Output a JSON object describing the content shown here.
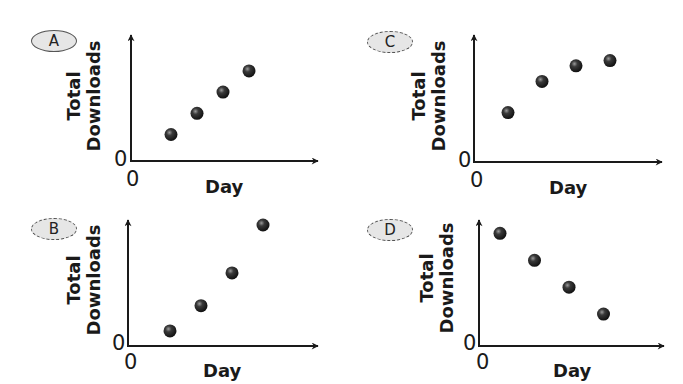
{
  "chart_data": [
    {
      "id": "A",
      "type": "scatter",
      "badge": "A",
      "title": "",
      "xlabel": "Day",
      "ylabel_line1": "Total",
      "ylabel_line2": "Downloads",
      "x_origin_label": "0",
      "y_origin_label": "0",
      "grid": false,
      "trend": "increasing linear",
      "x": [
        1,
        2,
        3,
        4
      ],
      "y": [
        1,
        1.8,
        2.6,
        3.4
      ],
      "xlim": [
        0,
        7.2
      ],
      "ylim": [
        0,
        4.8
      ]
    },
    {
      "id": "C",
      "type": "scatter",
      "badge": "C",
      "title": "",
      "xlabel": "Day",
      "ylabel_line1": "Total",
      "ylabel_line2": "Downloads",
      "x_origin_label": "0",
      "y_origin_label": "0",
      "grid": false,
      "trend": "increasing, leveling off",
      "x": [
        1,
        2,
        3,
        4
      ],
      "y": [
        1.9,
        3.1,
        3.7,
        3.9
      ],
      "xlim": [
        0,
        6.0
      ],
      "ylim": [
        0,
        5.0
      ]
    },
    {
      "id": "B",
      "type": "scatter",
      "badge": "B",
      "title": "",
      "xlabel": "Day",
      "ylabel_line1": "Total",
      "ylabel_line2": "Downloads",
      "x_origin_label": "0",
      "y_origin_label": "0",
      "grid": false,
      "trend": "increasing, accelerating",
      "x": [
        1,
        2,
        3,
        4
      ],
      "y": [
        0.6,
        1.6,
        2.9,
        4.8
      ],
      "xlim": [
        0,
        6.1
      ],
      "ylim": [
        0,
        5.0
      ]
    },
    {
      "id": "D",
      "type": "scatter",
      "badge": "D",
      "title": "",
      "xlabel": "Day",
      "ylabel_line1": "Total",
      "ylabel_line2": "Downloads",
      "x_origin_label": "0",
      "y_origin_label": "0",
      "grid": false,
      "trend": "decreasing linear",
      "x": [
        1,
        2,
        3,
        4
      ],
      "y": [
        4.6,
        3.5,
        2.4,
        1.3
      ],
      "xlim": [
        0,
        5.4
      ],
      "ylim": [
        0,
        5.2
      ]
    }
  ],
  "panels": {
    "A": {
      "badge": "A",
      "xlabel": "Day",
      "ylabel_line1": "Total",
      "ylabel_line2": "Downloads",
      "zero_x": "0",
      "zero_y": "0"
    },
    "B": {
      "badge": "B",
      "xlabel": "Day",
      "ylabel_line1": "Total",
      "ylabel_line2": "Downloads",
      "zero_x": "0",
      "zero_y": "0"
    },
    "C": {
      "badge": "C",
      "xlabel": "Day",
      "ylabel_line1": "Total",
      "ylabel_line2": "Downloads",
      "zero_x": "0",
      "zero_y": "0"
    },
    "D": {
      "badge": "D",
      "xlabel": "Day",
      "ylabel_line1": "Total",
      "ylabel_line2": "Downloads",
      "zero_x": "0",
      "zero_y": "0"
    }
  },
  "colors": {
    "axis": "#1a1a1a",
    "point": "#2a2a2a",
    "point_highlight": "#8a8a8a",
    "badge_fill": "#e6e6e6",
    "badge_border": "#555555"
  }
}
